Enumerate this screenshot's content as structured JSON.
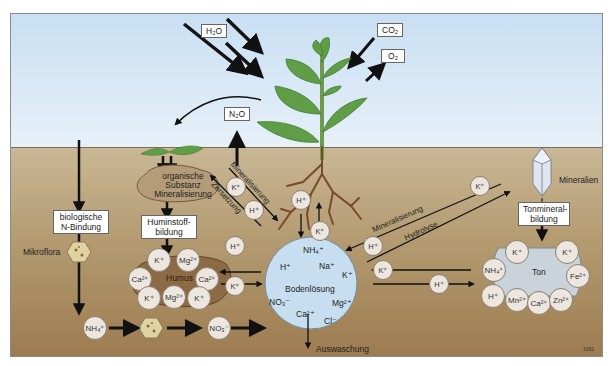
{
  "diagram": {
    "type": "nutrient-cycle",
    "atmosphere": {
      "h2o": "H₂O",
      "co2": "CO₂",
      "o2": "O₂",
      "n2o": "N₂O"
    },
    "organic": {
      "label_line1": "organische",
      "label_line2": "Substanz",
      "label_line3": "Mineralisierung"
    },
    "humic": {
      "box_line1": "Huminstoff-",
      "box_line2": "bildung",
      "core": "Humus",
      "ions": [
        "K⁺",
        "Mg²⁺",
        "Ca²⁺",
        "Ca²⁺",
        "K⁺",
        "Mg²⁺",
        "K⁺"
      ]
    },
    "bio_n": {
      "box_line1": "biologische",
      "box_line2": "N-Bindung",
      "microflora": "Mikroflora",
      "nh4": "NH₄⁺",
      "no3": "NO₃⁻"
    },
    "processes": {
      "mineralisierung_left": "Mineralisierung",
      "zersetzung": "Zersetzung",
      "mineralisierung_right": "Mineralisierung",
      "hydrolyse": "Hydrolyse",
      "auswaschung": "Auswaschung"
    },
    "exchange_ions": {
      "k_left_diag": "K⁺",
      "h_left_diag": "H⁺",
      "h_humus": "H⁺",
      "k_humus": "K⁺",
      "h_root": "H⁺",
      "k_root": "K⁺",
      "k_right_diag": "K⁺",
      "h_right_diag": "H⁺",
      "k_clay": "K⁺",
      "h_clay": "H⁺"
    },
    "soil_solution": {
      "label": "Bodenlösung",
      "ions": {
        "nh4": "NH₄⁺",
        "na": "Na⁺",
        "h": "H⁺",
        "k": "K⁺",
        "no3": "NO₃⁻",
        "mg": "Mg²⁺",
        "ca": "Ca²⁺",
        "cl": "Cl⁻"
      }
    },
    "minerals": {
      "label": "Mineralien",
      "box_line1": "Tonmineral-",
      "box_line2": "bildung",
      "clay_core": "Ton",
      "clay_ions": [
        "K⁺",
        "K⁺",
        "NH₄⁺",
        "Fe²⁺",
        "H⁺",
        "Mn²⁺",
        "Ca²⁺",
        "Zn²⁺"
      ]
    },
    "figure_id": "3181"
  }
}
